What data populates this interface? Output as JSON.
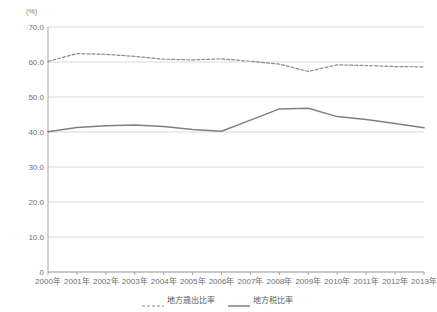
{
  "chart_data": {
    "type": "line",
    "title": "",
    "subtitle": "",
    "xlabel": "",
    "ylabel": "",
    "unit_label": "(%)",
    "x": [
      "2000年",
      "2001年",
      "2002年",
      "2003年",
      "2004年",
      "2005年",
      "2006年",
      "2007年",
      "2008年",
      "2009年",
      "2010年",
      "2011年",
      "2012年",
      "2013年"
    ],
    "categories": [
      "2000年",
      "2001年",
      "2002年",
      "2003年",
      "2004年",
      "2005年",
      "2006年",
      "2007年",
      "2008年",
      "2009年",
      "2010年",
      "2011年",
      "2012年",
      "2013年"
    ],
    "series": [
      {
        "name": "地方歳出比率",
        "style": "dashed",
        "color": "#8c8c8c",
        "values": [
          60.2,
          62.4,
          62.2,
          61.6,
          60.8,
          60.6,
          60.9,
          60.2,
          59.4,
          57.3,
          59.2,
          59.0,
          58.7,
          58.6
        ]
      },
      {
        "name": "地方税比率",
        "style": "solid",
        "color": "#808080",
        "values": [
          40.1,
          41.3,
          41.8,
          42.0,
          41.6,
          40.7,
          40.2,
          43.4,
          46.6,
          46.8,
          44.4,
          43.6,
          42.4,
          41.2
        ]
      }
    ],
    "ylim": [
      0,
      70
    ],
    "yticks": [
      70.0,
      60.0,
      50.0,
      40.0,
      30.0,
      20.0,
      10.0,
      0
    ],
    "ytick_labels": [
      "70.0",
      "60.0",
      "50.0",
      "40.0",
      "30.0",
      "20.0",
      "10.0",
      "0"
    ],
    "grid": true,
    "grid_axis": "y",
    "legend_position": "bottom",
    "legend": [
      "地方歳出比率",
      "地方税比率"
    ],
    "colors": {
      "grid": "#d9d9d9",
      "axis": "#a6a6a6",
      "text": "#6f6f6f",
      "series_dashed": "#8c8c8c",
      "series_solid": "#808080",
      "background": "#ffffff"
    }
  }
}
